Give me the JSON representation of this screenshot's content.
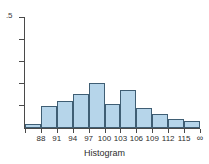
{
  "chart_data": {
    "type": "bar",
    "title": "",
    "xlabel": "Histogram",
    "ylabel": "",
    "ylim": [
      0,
      0.5
    ],
    "y_top_tick_label": ".5",
    "y_tick_values": [
      0.5,
      0.4,
      0.3,
      0.2,
      0.1
    ],
    "grid": false,
    "legend": "none",
    "bin_edges_labels": [
      "88",
      "91",
      "94",
      "97",
      "100",
      "103",
      "106",
      "109",
      "112",
      "115",
      "∞"
    ],
    "categories": [
      "85-88",
      "88-91",
      "91-94",
      "94-97",
      "97-100",
      "100-103",
      "103-106",
      "106-109",
      "109-112",
      "112-115",
      "115-∞"
    ],
    "values": [
      0.018,
      0.1,
      0.122,
      0.155,
      0.205,
      0.11,
      0.17,
      0.091,
      0.064,
      0.041,
      0.032
    ]
  },
  "axis": {
    "y_label_top": ".5",
    "x_title": "Histogram",
    "x_tick_labels": [
      "88",
      "91",
      "94",
      "97",
      "100",
      "103",
      "106",
      "109",
      "112",
      "115",
      "∞"
    ]
  },
  "style": {
    "bar_fill": "#b6d5ea",
    "bar_stroke": "#3f5e74",
    "axis_color": "#4a4a4a",
    "text_color": "#2d2d2d",
    "background": "#ffffff"
  }
}
